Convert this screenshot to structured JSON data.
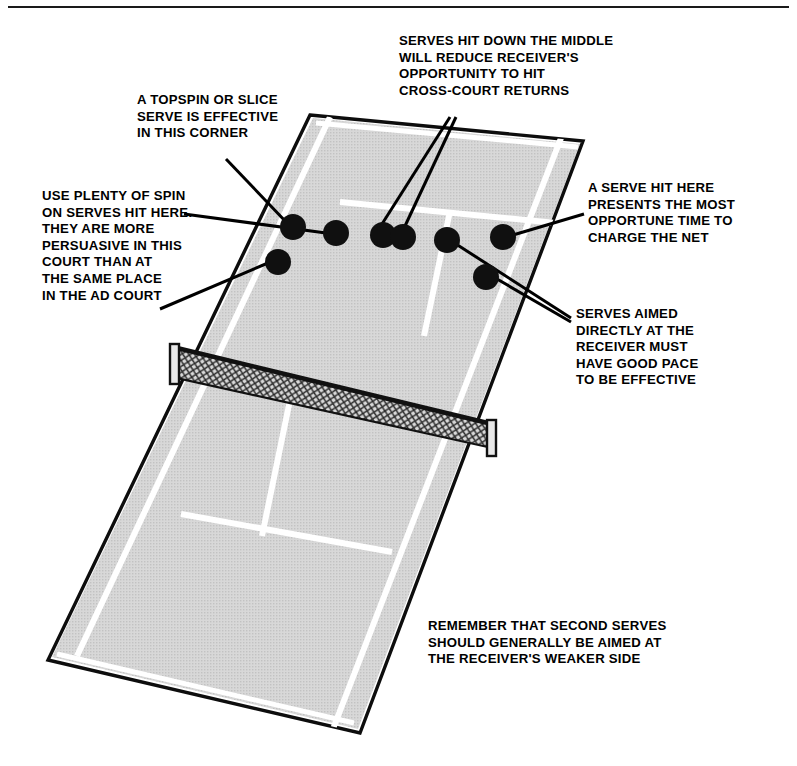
{
  "figure": {
    "view": "perspective-deuce-court-from-server-baseline",
    "colors": {
      "ink": "#000000",
      "court_fill": "#d6d6d6",
      "court_line": "#ffffff",
      "net_mesh": "#4a4a4a",
      "ball": "#101010",
      "page": "#ffffff"
    }
  },
  "callouts": [
    {
      "id": "serves-middle",
      "text": "SERVES HIT DOWN THE MIDDLE\nWILL REDUCE RECEIVER'S\nOPPORTUNITY TO HIT\nCROSS-COURT RETURNS"
    },
    {
      "id": "topspin-slice",
      "text": "A TOPSPIN OR SLICE\nSERVE IS EFFECTIVE\nIN THIS CORNER"
    },
    {
      "id": "use-plenty-of-spin",
      "text": "USE PLENTY OF SPIN\nON SERVES HIT HERE.\nTHEY ARE MORE\nPERSUASIVE IN THIS\nCOURT THAN AT\nTHE SAME PLACE\nIN THE AD COURT"
    },
    {
      "id": "serve-hit-here",
      "text": "A SERVE HIT HERE\nPRESENTS THE MOST\nOPPORTUNE TIME TO\nCHARGE THE NET"
    },
    {
      "id": "serves-aimed",
      "text": "SERVES AIMED\nDIRECTLY AT THE\nRECEIVER MUST\nHAVE GOOD PACE\nTO BE EFFECTIVE"
    },
    {
      "id": "remember-second-serves",
      "text": "REMEMBER THAT SECOND SERVES\nSHOULD GENERALLY BE AIMED AT\nTHE RECEIVER'S WEAKER SIDE"
    }
  ],
  "court": {
    "outline": "310,115 583,141 360,733 48,660",
    "singles_left": "329,117 76,655",
    "singles_right": "561,138 333,728",
    "service_line_far": "345,203 553,223",
    "center_service_line": "449,212 427,327",
    "service_line_near": "186,516 386,549",
    "baseline_near": "60,655 352,722",
    "baseline_far": "318,122 576,146",
    "net_line": "177,348 492,428"
  },
  "net": {
    "top_left": "177,348",
    "top_right": "492,424",
    "bottom_left": "177,378",
    "bottom_right": "492,448",
    "post_left_x": 174,
    "post_right_x": 489
  },
  "balls": [
    {
      "id": "ball-corner-wide",
      "cx": 293,
      "cy": 227,
      "r": 13
    },
    {
      "id": "ball-body-left",
      "cx": 336,
      "cy": 233,
      "r": 13
    },
    {
      "id": "ball-middle-a",
      "cx": 383,
      "cy": 235,
      "r": 13
    },
    {
      "id": "ball-middle-b",
      "cx": 403,
      "cy": 237,
      "r": 13
    },
    {
      "id": "ball-center-t",
      "cx": 447,
      "cy": 240,
      "r": 13
    },
    {
      "id": "ball-right-wide",
      "cx": 503,
      "cy": 237,
      "r": 13
    },
    {
      "id": "ball-short-left",
      "cx": 278,
      "cy": 262,
      "r": 13
    },
    {
      "id": "ball-short-right",
      "cx": 486,
      "cy": 277,
      "r": 13
    }
  ],
  "leader_lines": [
    {
      "id": "leader-topspin",
      "from": "226,159",
      "to": "288,224"
    },
    {
      "id": "leader-middle-a",
      "from": "450,117",
      "to": "382,224"
    },
    {
      "id": "leader-middle-b",
      "from": "455,117",
      "to": "404,226"
    },
    {
      "id": "leader-spin-upper",
      "from": "184,214",
      "to": "326,232"
    },
    {
      "id": "leader-spin-lower",
      "from": "163,308",
      "to": "268,262"
    },
    {
      "id": "leader-serve-here",
      "from": "584,214",
      "to": "512,235"
    },
    {
      "id": "leader-aimed-hi",
      "from": "570,318",
      "to": "456,243"
    },
    {
      "id": "leader-aimed-lo",
      "from": "570,322",
      "to": "496,278"
    }
  ]
}
